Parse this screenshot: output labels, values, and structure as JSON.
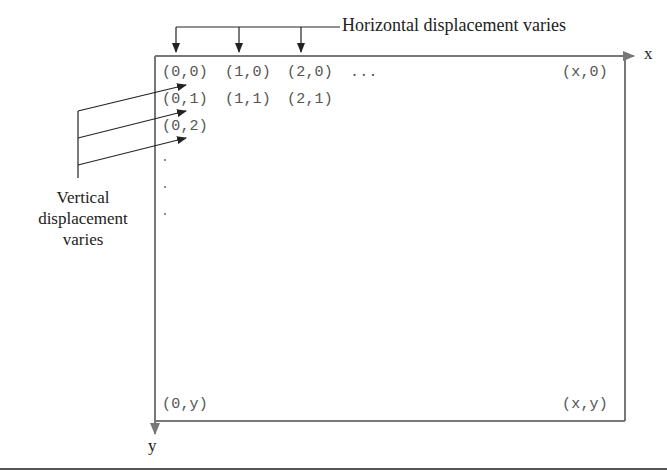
{
  "diagram": {
    "horizontal_label": "Horizontal displacement varies",
    "vertical_label_lines": [
      "Vertical",
      "displacement",
      "varies"
    ],
    "axes": {
      "x_label": "x",
      "y_label": "y"
    },
    "grid_labels": {
      "row0": [
        "(0,0)",
        "(1,0)",
        "(2,0)",
        "..."
      ],
      "row1": [
        "(0,1)",
        "(1,1)",
        "(2,1)"
      ],
      "row2": [
        "(0,2)"
      ],
      "top_right": "(x,0)",
      "bottom_left": "(0,y)",
      "bottom_right": "(x,y)"
    },
    "colors": {
      "box_stroke": "#777777",
      "arrow_stroke": "#222222",
      "coord_text": "#555555",
      "label_text": "#222222"
    }
  }
}
